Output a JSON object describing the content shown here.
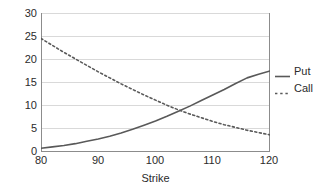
{
  "chart_data": {
    "type": "line",
    "title": "",
    "subtitle": "",
    "xlabel": "Strike",
    "ylabel": "",
    "xlim": [
      80,
      120
    ],
    "ylim": [
      0,
      30
    ],
    "grid": "horizontal",
    "legend_position": "right",
    "x_ticks": [
      "80",
      "90",
      "100",
      "110",
      "120"
    ],
    "y_ticks": [
      "0",
      "5",
      "10",
      "15",
      "20",
      "25",
      "30"
    ],
    "x": [
      80,
      82,
      84,
      86,
      88,
      90,
      92,
      94,
      96,
      98,
      100,
      102,
      104,
      106,
      108,
      110,
      112,
      114,
      116,
      118,
      120
    ],
    "series": [
      {
        "name": "Put",
        "style": "solid",
        "color": "#595959",
        "values": [
          0.8,
          1.1,
          1.4,
          1.8,
          2.3,
          2.8,
          3.4,
          4.1,
          4.9,
          5.8,
          6.7,
          7.7,
          8.8,
          9.9,
          11.1,
          12.3,
          13.5,
          14.8,
          16.0,
          16.8,
          17.5
        ]
      },
      {
        "name": "Call",
        "style": "dotted",
        "color": "#595959",
        "values": [
          24.5,
          23.0,
          21.5,
          20.1,
          18.7,
          17.3,
          16.0,
          14.7,
          13.5,
          12.3,
          11.2,
          10.1,
          9.1,
          8.2,
          7.4,
          6.6,
          5.9,
          5.3,
          4.7,
          4.2,
          3.7
        ]
      }
    ],
    "legend": [
      {
        "label": "Put",
        "style": "solid"
      },
      {
        "label": "Call",
        "style": "dotted"
      }
    ]
  },
  "axis": {
    "y_labels": [
      "30",
      "25",
      "20",
      "15",
      "10",
      "5",
      "0"
    ],
    "x_labels": [
      "80",
      "90",
      "100",
      "110",
      "120"
    ],
    "x_title": "Strike"
  },
  "legend": {
    "put_label": "Put",
    "call_label": "Call"
  },
  "colors": {
    "line": "#595959",
    "grid": "#d9d9d9",
    "axis": "#808080",
    "text": "#2b2b2b",
    "background": "#ffffff"
  }
}
